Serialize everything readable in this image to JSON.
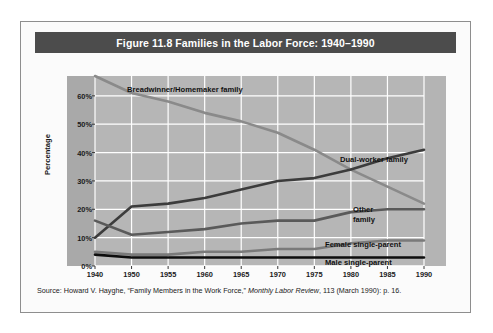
{
  "figure": {
    "title": "Figure 11.8  Families in the Labor Force: 1940–1990",
    "source_prefix": "Source: Howard V. Hayghe, “Family Members in the Work Force,” ",
    "source_italic": "Monthly Labor Review",
    "source_suffix": ", 113 (March 1990): p. 16."
  },
  "colors": {
    "title_bar": "#4c4c4c",
    "plot_background": "#b6b6b6",
    "axis_band_left": "#a9a9a9",
    "axis_band_right": "#b4b4b4",
    "gridline": "#ffffff",
    "breadwinner": "#8a8a8a",
    "dual_worker": "#3c3c3c",
    "other_family": "#5a5a5a",
    "female_single_parent": "#7a7a7a",
    "male_single_parent": "#0d0d0d",
    "card_border": "#8e8e8e",
    "page_background": "#ffffff"
  },
  "chart_data": {
    "type": "line",
    "title": "Figure 11.8  Families in the Labor Force: 1940–1990",
    "xlabel": "",
    "ylabel": "Percentage",
    "x": [
      1940,
      1950,
      1955,
      1960,
      1965,
      1970,
      1975,
      1980,
      1985,
      1990
    ],
    "xtick_labels": [
      "1940",
      "1950",
      "1955",
      "1960",
      "1965",
      "1970",
      "1975",
      "1980",
      "1985",
      "1990"
    ],
    "ytick_labels": [
      "0%",
      "10%",
      "20%",
      "30%",
      "40%",
      "50%",
      "60%"
    ],
    "yticks": [
      0,
      10,
      20,
      30,
      40,
      50,
      60
    ],
    "ylim": [
      0,
      67
    ],
    "xlim": [
      1940,
      1990
    ],
    "grid": true,
    "legend_position": "inline-annotations",
    "series": [
      {
        "name": "Breadwinner/Homemaker family",
        "color": "#8a8a8a",
        "values": [
          67,
          61,
          58,
          54,
          51,
          47,
          41,
          34,
          28,
          22
        ]
      },
      {
        "name": "Dual-worker family",
        "color": "#3c3c3c",
        "values": [
          10,
          21,
          22,
          24,
          27,
          30,
          31,
          34,
          38,
          41
        ]
      },
      {
        "name": "Other family",
        "color": "#5a5a5a",
        "values": [
          16,
          11,
          12,
          13,
          15,
          16,
          16,
          19,
          20,
          20
        ]
      },
      {
        "name": "Female single-parent",
        "color": "#7a7a7a",
        "values": [
          5,
          4,
          4,
          5,
          5,
          6,
          6,
          8,
          9,
          9
        ]
      },
      {
        "name": "Male single-parent",
        "color": "#0d0d0d",
        "values": [
          4,
          3,
          3,
          3,
          3,
          3,
          3,
          3,
          3,
          3
        ]
      }
    ],
    "annotations": [
      {
        "text": "Breadwinner/Homemaker family",
        "for": "Breadwinner/Homemaker family"
      },
      {
        "text": "Dual-worker family",
        "for": "Dual-worker family"
      },
      {
        "text": "Other\nfamily",
        "for": "Other family"
      },
      {
        "text": "Female single-parent",
        "for": "Female single-parent"
      },
      {
        "text": "Male single-parent",
        "for": "Male single-parent"
      }
    ]
  }
}
